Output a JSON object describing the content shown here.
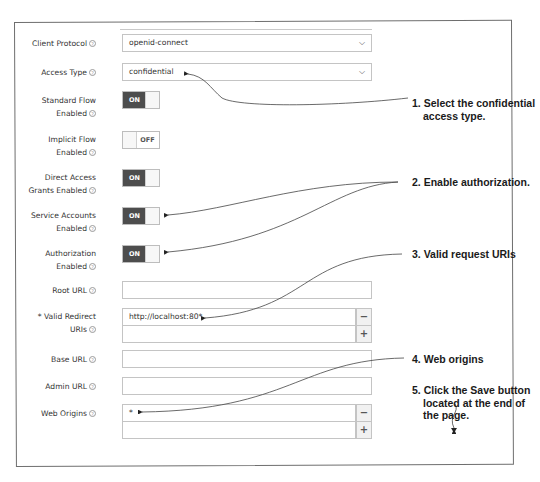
{
  "form": {
    "client_protocol": {
      "label": "Client Protocol",
      "value": "openid-connect",
      "icon": "help-icon"
    },
    "access_type": {
      "label": "Access Type",
      "value": "confidential",
      "icon": "help-icon"
    },
    "standard_flow": {
      "label_line1": "Standard Flow",
      "label_line2": "Enabled",
      "state": "ON"
    },
    "implicit_flow": {
      "label_line1": "Implicit Flow",
      "label_line2": "Enabled",
      "state": "OFF"
    },
    "direct_access": {
      "label_line1": "Direct Access",
      "label_line2": "Grants Enabled",
      "state": "ON"
    },
    "service_accounts": {
      "label_line1": "Service Accounts",
      "label_line2": "Enabled",
      "state": "ON"
    },
    "authorization": {
      "label_line1": "Authorization",
      "label_line2": "Enabled",
      "state": "ON"
    },
    "root_url": {
      "label": "Root URL",
      "value": ""
    },
    "valid_redirect": {
      "label_line1": "* Valid Redirect",
      "label_line2": "URIs",
      "values": [
        "http://localhost:80*",
        ""
      ],
      "remove_label": "−",
      "add_label": "+"
    },
    "base_url": {
      "label": "Base URL",
      "value": ""
    },
    "admin_url": {
      "label": "Admin URL",
      "value": ""
    },
    "web_origins": {
      "label": "Web Origins",
      "values": [
        "*",
        ""
      ],
      "remove_label": "−",
      "add_label": "+"
    },
    "help_glyph": "?",
    "chevron_glyph": "⌄"
  },
  "callouts": {
    "c1_line1": "1. Select the confidential",
    "c1_line2": "access type.",
    "c2": "2. Enable authorization.",
    "c3": "3. Valid request URIs",
    "c4": "4. Web origins",
    "c5_line1": "5. Click the Save button",
    "c5_line2": "located at the end of",
    "c5_line3": "the page."
  },
  "colors": {
    "toggle_on": "#4d4d4d",
    "border": "#c4c4c4",
    "frame": "#6e6e6e"
  }
}
